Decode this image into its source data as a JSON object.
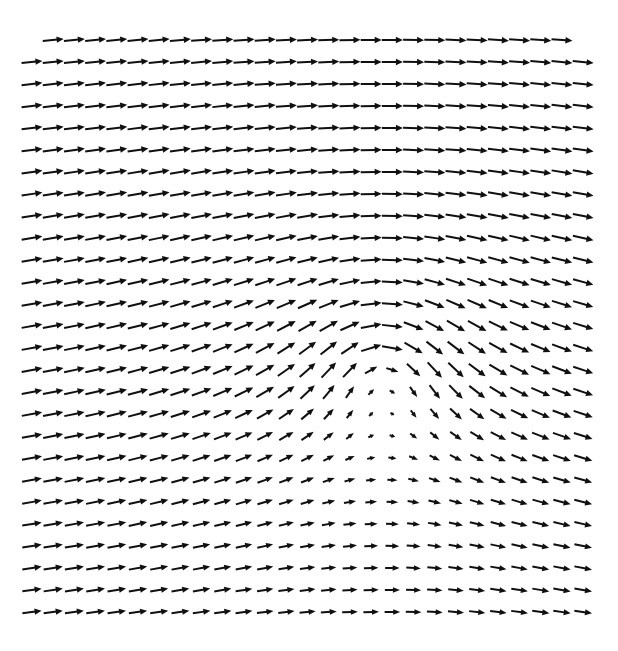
{
  "figure": {
    "caption": "",
    "background_color": "#ffffff",
    "arrow_color": "#101010",
    "canvas": {
      "width": 618,
      "height": 651
    }
  },
  "chart_data": {
    "type": "quiver",
    "subtitle": "",
    "xlabel": "",
    "ylabel": "",
    "grid": false,
    "legend": null,
    "annotations": [],
    "plot_area": {
      "x0": 32,
      "y0": 40,
      "x1": 583,
      "y1": 612
    },
    "grid_shape": {
      "columns": 27,
      "rows": 27
    },
    "spacing": {
      "dx": 21.2,
      "dy": 22.0
    },
    "xlim": [
      0,
      26
    ],
    "ylim": [
      0,
      26
    ],
    "arrow_scale": 20.0,
    "arrow_max_length": 21.0,
    "arrow_head_length": 7.0,
    "arrow_head_width": 6.4,
    "shaft_width": 2.0,
    "field_model": {
      "description": "Uniform rightward freestream plus a clockwise point vortex with a Gaussian (Lamb-Oseen) core; a saddle point forms upstream of the vortex center.",
      "uniform_flow": {
        "u": 1.0,
        "v": 0.0
      },
      "vortices": [
        {
          "name": "primary-clockwise-vortex",
          "center_px": {
            "x": 385,
            "y": 352
          },
          "center_grid": {
            "col": 16.65,
            "row": 14.18
          },
          "circulation": -3.05,
          "core_radius_grid": 2.35,
          "rotation": "clockwise"
        }
      ],
      "critical_points": [
        {
          "name": "vortex-center",
          "type": "center",
          "px": {
            "x": 385,
            "y": 352
          }
        },
        {
          "name": "upstream-saddle",
          "type": "saddle",
          "px": {
            "x": 228,
            "y": 347
          }
        }
      ]
    },
    "first_row_starts_at_column": 1,
    "notes": [
      "Far-field arrows point right at full length.",
      "Above the vortex center arrows tilt down and to the right, turning to straight down near x of the core.",
      "Left of the vortex center arrows point left, forming a reversed-flow lane through the mid height.",
      "Below the vortex center arrows tilt up and to the right, turning to straight up near x of the core.",
      "Arrow lengths shrink to near zero at the vortex center and at the upstream saddle."
    ]
  }
}
